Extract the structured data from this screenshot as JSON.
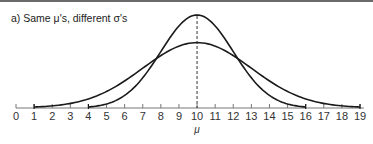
{
  "chart_data": {
    "type": "line",
    "title": "a)  Same μ's, different σ's",
    "xlabel": "μ",
    "ylabel": "",
    "x_ticks": [
      0,
      1,
      2,
      3,
      4,
      5,
      6,
      7,
      8,
      9,
      10,
      11,
      12,
      13,
      14,
      15,
      16,
      17,
      18,
      19
    ],
    "xlim": [
      0,
      19
    ],
    "grid": false,
    "legend": null,
    "annotations": [
      {
        "type": "dashed-vertical-line",
        "x": 10,
        "label": "μ"
      }
    ],
    "series": [
      {
        "name": "narrow (smaller σ)",
        "mean": 10,
        "range": [
          4,
          16
        ],
        "peak_relative": 1.0
      },
      {
        "name": "wide (larger σ)",
        "mean": 10,
        "range": [
          1,
          19
        ],
        "peak_relative": 0.7
      }
    ]
  },
  "labels": {
    "title": "a)  Same μ's, different σ's",
    "mu": "μ",
    "ticks": [
      "0",
      "1",
      "2",
      "3",
      "4",
      "5",
      "6",
      "7",
      "8",
      "9",
      "10",
      "11",
      "12",
      "13",
      "14",
      "15",
      "16",
      "17",
      "18",
      "19"
    ]
  }
}
